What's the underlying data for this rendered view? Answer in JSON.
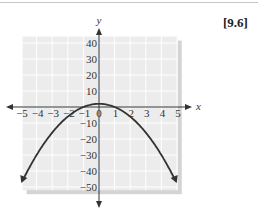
{
  "reference": "[9.6]",
  "chart_data": {
    "type": "line",
    "title": "",
    "xlabel": "x",
    "ylabel": "y",
    "xlim": [
      -5,
      5
    ],
    "ylim": [
      -50,
      40
    ],
    "x_ticks": [
      "−5",
      "−4",
      "−3",
      "−2",
      "−1",
      "0",
      "1",
      "2",
      "3",
      "4",
      "5"
    ],
    "y_ticks": [
      "40",
      "30",
      "20",
      "10",
      "−10",
      "−20",
      "−30",
      "−40",
      "−50"
    ],
    "grid": true,
    "series": [
      {
        "name": "parabola",
        "equation": "y = -2x^2 + 2",
        "x": [
          -5,
          -4,
          -3,
          -2,
          -1,
          0,
          1,
          2,
          3,
          4,
          5
        ],
        "y": [
          -48,
          -30,
          -16,
          -6,
          0,
          2,
          0,
          -6,
          -16,
          -30,
          -48
        ]
      }
    ],
    "colors": {
      "grid_bg": "#ececec",
      "grid_line": "#ffffff",
      "curve": "#333333",
      "shadow": "#d4d4d4"
    }
  }
}
